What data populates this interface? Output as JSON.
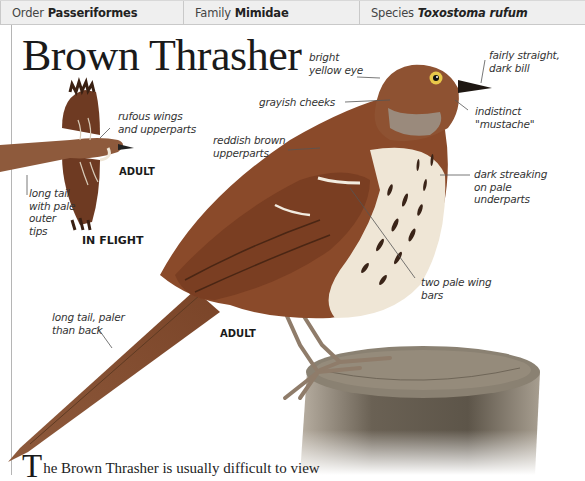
{
  "header": {
    "order": {
      "key": "Order",
      "value": "Passeriformes"
    },
    "family": {
      "key": "Family",
      "value": "Mimidae"
    },
    "species": {
      "key": "Species",
      "value": "Toxostoma rufum"
    }
  },
  "title": "Brown Thrasher",
  "flight_figure": {
    "labels": {
      "wings": "rufous wings\nand upperparts",
      "tail": "long tail\nwith pale\nouter\ntips"
    },
    "age_tag": "ADULT",
    "caption": "IN FLIGHT"
  },
  "main_figure": {
    "labels": {
      "eye": "bright\nyellow eye",
      "bill": "fairly straight,\ndark bill",
      "cheeks": "grayish cheeks",
      "mustache": "indistinct\n\"mustache\"",
      "upperparts": "reddish brown\nupperparts",
      "underparts": "dark streaking\non pale\nunderparts",
      "wingbars": "two pale wing\nbars",
      "tail": "long tail, paler\nthan back"
    },
    "age_tag": "ADULT"
  },
  "body": {
    "dropcap": "T",
    "text": "he Brown Thrasher is usually difficult to view"
  },
  "colors": {
    "header_bg": "#efefef",
    "plumage": "#8a4a2a",
    "underparts": "#efe6d6",
    "post": "#6f6658"
  }
}
